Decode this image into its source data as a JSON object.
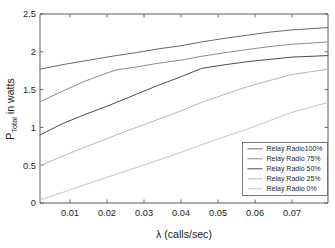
{
  "chart_data": {
    "type": "line",
    "title": "",
    "xlabel": "λ (calls/sec)",
    "ylabel": "P_Total in watts",
    "ylabel_main": "P",
    "ylabel_sub": "Total",
    "ylabel_rest": " in watts",
    "xlim": [
      0.0019,
      0.0797
    ],
    "ylim": [
      0,
      2.5
    ],
    "xticks": [
      0.01,
      0.02,
      0.03,
      0.04,
      0.05,
      0.06,
      0.07
    ],
    "xtick_labels": [
      "0.01",
      "0.02",
      "0.03",
      "0.04",
      "0.05",
      "0.06",
      "0.07"
    ],
    "yticks": [
      0,
      0.5,
      1,
      1.5,
      2,
      2.5
    ],
    "ytick_labels": [
      "0",
      "0.5",
      "1",
      "1.5",
      "2",
      "2.5"
    ],
    "grid": false,
    "legend_position": "lower right",
    "x": [
      0.0019,
      0.008,
      0.014,
      0.02,
      0.0225,
      0.028,
      0.034,
      0.04,
      0.0455,
      0.052,
      0.058,
      0.064,
      0.07,
      0.0797
    ],
    "series": [
      {
        "name": "Relay Radio100%",
        "color": "#6b6b6b",
        "values": [
          1.77,
          1.83,
          1.88,
          1.93,
          1.95,
          1.99,
          2.04,
          2.08,
          2.13,
          2.18,
          2.22,
          2.26,
          2.29,
          2.32
        ]
      },
      {
        "name": "Relay Radio 75%",
        "color": "#8c8c8c",
        "values": [
          1.34,
          1.48,
          1.61,
          1.72,
          1.76,
          1.8,
          1.85,
          1.89,
          1.94,
          1.99,
          2.03,
          2.07,
          2.1,
          2.13
        ]
      },
      {
        "name": "Relay Radio 50%",
        "color": "#4d4d4d",
        "values": [
          0.9,
          1.05,
          1.17,
          1.28,
          1.33,
          1.44,
          1.56,
          1.67,
          1.78,
          1.83,
          1.87,
          1.9,
          1.93,
          1.95
        ]
      },
      {
        "name": "Relay Radio 25%",
        "color": "#b5b5b5",
        "values": [
          0.49,
          0.62,
          0.74,
          0.85,
          0.9,
          1.0,
          1.11,
          1.22,
          1.33,
          1.44,
          1.54,
          1.62,
          1.7,
          1.77
        ]
      },
      {
        "name": "Relay Radio 0%",
        "color": "#c4c4c4",
        "values": [
          0.04,
          0.14,
          0.24,
          0.34,
          0.38,
          0.47,
          0.57,
          0.67,
          0.77,
          0.88,
          0.98,
          1.09,
          1.2,
          1.33
        ]
      }
    ]
  },
  "legend": {
    "items": [
      {
        "label": "Relay Radio100%"
      },
      {
        "label": "Relay Radio 75%"
      },
      {
        "label": "Relay Radio 50%"
      },
      {
        "label": "Relay Radio 25%"
      },
      {
        "label": "Relay Radio 0%"
      }
    ]
  }
}
